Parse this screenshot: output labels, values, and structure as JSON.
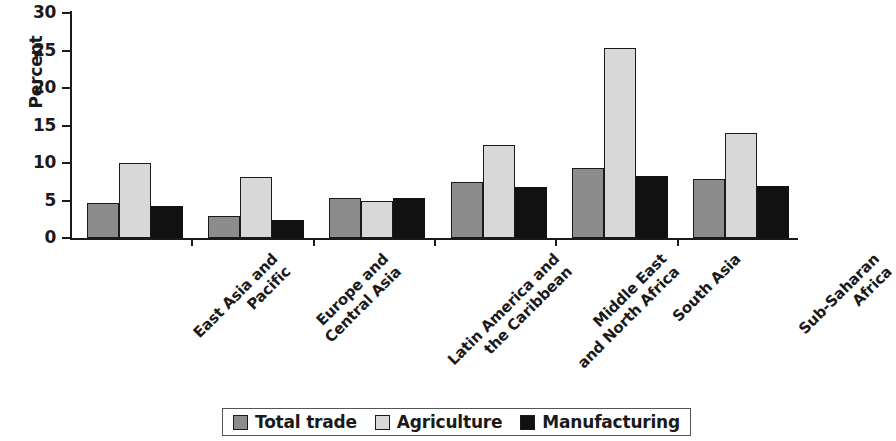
{
  "chart_data": {
    "type": "bar",
    "title": "",
    "xlabel": "",
    "ylabel": "Percent",
    "ylim": [
      0,
      30
    ],
    "yticks": [
      0,
      5,
      10,
      15,
      20,
      25,
      30
    ],
    "grid": false,
    "legend_position": "bottom",
    "categories": [
      "East Asia and\nPacific",
      "Europe and\nCentral Asia",
      "Latin America and\nthe Caribbean",
      "Middle East\nand North Africa",
      "South Asia",
      "Sub-Saharan\nAfrica"
    ],
    "category_lines": [
      [
        "East Asia and",
        "Pacific"
      ],
      [
        "Europe and",
        "Central Asia"
      ],
      [
        "Latin America and",
        "the Caribbean"
      ],
      [
        "Middle East",
        "and North Africa"
      ],
      [
        "South Asia",
        ""
      ],
      [
        "Sub-Saharan",
        "Africa"
      ]
    ],
    "series": [
      {
        "name": "Total trade",
        "color": "#8c8c8c",
        "values": [
          4.7,
          3.0,
          5.4,
          7.5,
          9.3,
          7.9
        ]
      },
      {
        "name": "Agriculture",
        "color": "#d8d8d8",
        "values": [
          10.0,
          8.1,
          5.0,
          12.4,
          25.3,
          14.0
        ]
      },
      {
        "name": "Manufacturing",
        "color": "#111111",
        "values": [
          4.3,
          2.4,
          5.4,
          6.8,
          8.3,
          7.0
        ]
      }
    ]
  },
  "axis": {
    "y_title": "Percent",
    "y_tick_labels": [
      "0",
      "5",
      "10",
      "15",
      "20",
      "25",
      "30"
    ]
  },
  "legend": {
    "items": [
      {
        "label": "Total trade",
        "swatch": "#8c8c8c",
        "icon": "legend-swatch-gray"
      },
      {
        "label": "Agriculture",
        "swatch": "#d8d8d8",
        "icon": "legend-swatch-light-gray"
      },
      {
        "label": "Manufacturing",
        "swatch": "#111111",
        "icon": "legend-swatch-black"
      }
    ]
  }
}
